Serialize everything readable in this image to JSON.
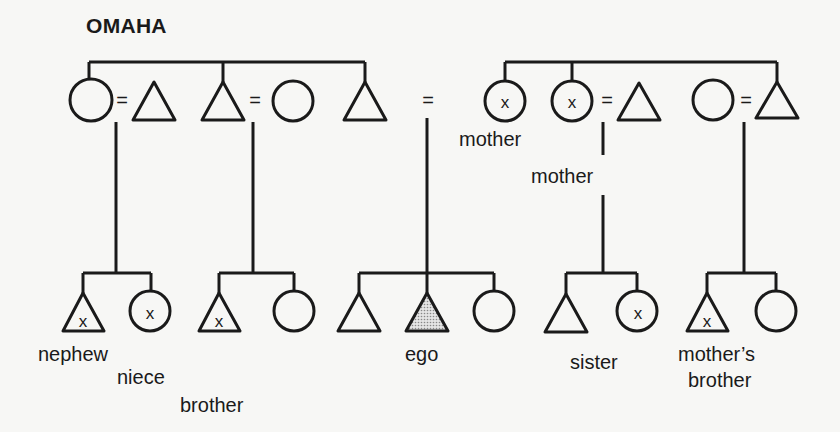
{
  "title": "OMAHA",
  "colors": {
    "line": "#1a1a1a",
    "ego_fill": "#b8b8b8",
    "background": "#f7f7f5"
  },
  "legend": {
    "triangle": "male",
    "circle": "female",
    "equals": "marriage",
    "x_mark": "same kin term marked",
    "shaded": "ego"
  },
  "upper_generation": {
    "siblings_left": [
      {
        "id": "u1",
        "shape": "circle",
        "x": 92,
        "marked": false
      },
      {
        "id": "u2",
        "shape": "triangle",
        "x": 154,
        "marked": false,
        "spouse_of": "u1"
      },
      {
        "id": "u3",
        "shape": "triangle",
        "x": 223,
        "marked": false
      },
      {
        "id": "u4",
        "shape": "circle",
        "x": 293,
        "marked": false,
        "spouse_of": "u3"
      },
      {
        "id": "u5",
        "shape": "triangle",
        "x": 365,
        "marked": false
      }
    ],
    "siblings_right": [
      {
        "id": "u6",
        "shape": "circle",
        "x": 505,
        "marked": true,
        "label": "mother"
      },
      {
        "id": "u7",
        "shape": "circle",
        "x": 571,
        "marked": true,
        "label": "mother"
      },
      {
        "id": "u8",
        "shape": "triangle",
        "x": 639,
        "marked": false,
        "spouse_of": "u7"
      },
      {
        "id": "u9",
        "shape": "circle",
        "x": 713,
        "marked": false
      },
      {
        "id": "u10",
        "shape": "triangle",
        "x": 776,
        "marked": false,
        "spouse_of": "u9"
      }
    ]
  },
  "lower_generation": [
    {
      "id": "l1",
      "shape": "triangle",
      "x": 83,
      "marked": true,
      "label": "nephew"
    },
    {
      "id": "l2",
      "shape": "circle",
      "x": 150,
      "marked": true,
      "label": "niece"
    },
    {
      "id": "l3",
      "shape": "triangle",
      "x": 220,
      "marked": true,
      "label": "brother"
    },
    {
      "id": "l4",
      "shape": "circle",
      "x": 294,
      "marked": false
    },
    {
      "id": "l5",
      "shape": "triangle",
      "x": 360,
      "marked": false
    },
    {
      "id": "l6",
      "shape": "triangle",
      "x": 427,
      "marked": false,
      "ego": true,
      "label": "ego"
    },
    {
      "id": "l7",
      "shape": "circle",
      "x": 494,
      "marked": false
    },
    {
      "id": "l8",
      "shape": "triangle",
      "x": 567,
      "marked": false
    },
    {
      "id": "l9",
      "shape": "circle",
      "x": 636,
      "marked": true,
      "label": "sister"
    },
    {
      "id": "l10",
      "shape": "triangle",
      "x": 708,
      "marked": true,
      "label": "mother's brother"
    },
    {
      "id": "l11",
      "shape": "circle",
      "x": 776,
      "marked": false
    }
  ],
  "labels": {
    "mother_1": "mother",
    "mother_2": "mother",
    "nephew": "nephew",
    "niece": "niece",
    "brother": "brother",
    "ego": "ego",
    "sister": "sister",
    "mothers_brother_1": "mother’s",
    "mothers_brother_2": "brother",
    "equals": "=",
    "x_mark": "x"
  }
}
